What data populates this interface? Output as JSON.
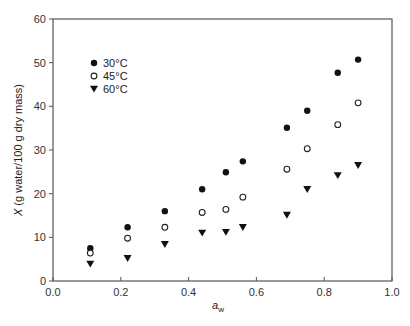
{
  "chart_data": {
    "type": "scatter",
    "title": "",
    "xlabel": "a_w",
    "xlabel_main": "a",
    "xlabel_sub": "w",
    "ylabel": "X (g water/100 g dry mass)",
    "ylabel_italic": "X",
    "ylabel_rest": " (g water/100 g dry mass)",
    "xlim": [
      0.0,
      1.0
    ],
    "ylim": [
      0,
      60
    ],
    "xticks": [
      "0.0",
      "0.2",
      "0.4",
      "0.6",
      "0.8",
      "1.0"
    ],
    "yticks": [
      "0",
      "10",
      "20",
      "30",
      "40",
      "50",
      "60"
    ],
    "grid": false,
    "legend_position": "upper-left",
    "x": [
      0.11,
      0.22,
      0.33,
      0.44,
      0.51,
      0.56,
      0.69,
      0.75,
      0.84,
      0.9
    ],
    "series": [
      {
        "name": "30°C",
        "marker": "filled-circle",
        "values": [
          7.5,
          12.3,
          16.0,
          21.0,
          24.9,
          27.4,
          35.1,
          39.0,
          47.7,
          50.7
        ]
      },
      {
        "name": "45°C",
        "marker": "open-circle",
        "values": [
          6.4,
          9.8,
          12.3,
          15.7,
          16.4,
          19.2,
          25.6,
          30.3,
          35.8,
          40.8
        ]
      },
      {
        "name": "60°C",
        "marker": "filled-triangle-down",
        "values": [
          3.9,
          5.2,
          8.4,
          11.0,
          11.2,
          12.3,
          15.1,
          21.0,
          24.2,
          26.5
        ]
      }
    ]
  },
  "colors": {
    "axis": "#555555",
    "marker": "#111111",
    "background": "#ffffff"
  }
}
